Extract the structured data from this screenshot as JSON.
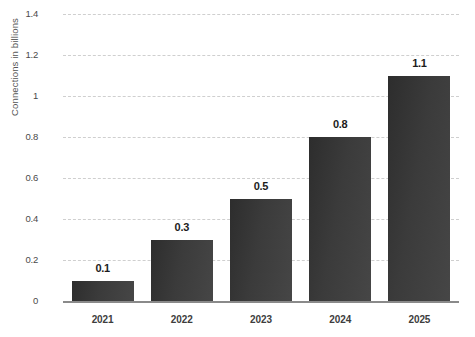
{
  "chart_data": {
    "type": "bar",
    "title": "",
    "subtitle": "",
    "xlabel": "",
    "ylabel": "Connections in billions",
    "categories": [
      "2021",
      "2022",
      "2023",
      "2024",
      "2025"
    ],
    "values": [
      0.1,
      0.3,
      0.5,
      0.8,
      1.1
    ],
    "value_labels": [
      "0.1",
      "0.3",
      "0.5",
      "0.8",
      "1.1"
    ],
    "series": [
      {
        "name": "Connections in billions",
        "values": [
          0.1,
          0.3,
          0.5,
          0.8,
          1.1
        ]
      }
    ],
    "ylim": [
      0,
      1.4
    ],
    "yticks": [
      0,
      0.2,
      0.4,
      0.6,
      0.8,
      1,
      1.2,
      1.4
    ],
    "ytick_labels": [
      "0",
      "0.2",
      "0.4",
      "0.6",
      "0.8",
      "1",
      "1.2",
      "1.4"
    ],
    "grid": true,
    "grid_axis": "y",
    "grid_style": "dashed",
    "legend": false,
    "legend_position": "none",
    "bar_color": "#3a3a3a",
    "grid_color": "#cfcfcf",
    "axis_color": "#8a8a8a",
    "label_color": "#1c1c1c",
    "background_color": "#ffffff"
  }
}
